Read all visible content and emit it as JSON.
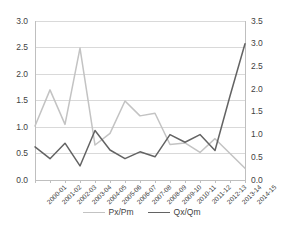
{
  "chart_data": {
    "type": "line",
    "title": "",
    "subtitle": "",
    "xlabel": "",
    "ylabel": "",
    "grid": true,
    "legend_position": "bottom",
    "categories": [
      "2000-01",
      "2001-02",
      "2002-03",
      "2003-04",
      "2004-05",
      "2005-06",
      "2006-07",
      "2007-08",
      "2008-09",
      "2009-10",
      "2010-11",
      "2011-12",
      "2012-13",
      "2013-14",
      "2014-15"
    ],
    "axes": {
      "left": {
        "label": "",
        "min": 0.0,
        "max": 3.0,
        "step": 0.5,
        "ticks": [
          "0.0",
          "0.5",
          "1.0",
          "1.5",
          "2.0",
          "2.5",
          "3.0"
        ]
      },
      "right": {
        "label": "",
        "min": 0.0,
        "max": 3.5,
        "step": 0.5,
        "ticks": [
          "0.0",
          "0.5",
          "1.0",
          "1.5",
          "2.0",
          "2.5",
          "3.0",
          "3.5"
        ]
      }
    },
    "series": [
      {
        "name": "Px/Pm",
        "axis": "left",
        "color": "#c3c3c3",
        "values": [
          1.02,
          1.7,
          1.05,
          2.49,
          0.66,
          0.88,
          1.49,
          1.21,
          1.26,
          0.67,
          0.7,
          0.52,
          0.78,
          0.5,
          0.22
        ]
      },
      {
        "name": "Qx/Qm",
        "axis": "right",
        "color": "#636363",
        "values": [
          0.73,
          0.47,
          0.81,
          0.31,
          1.09,
          0.66,
          0.47,
          0.62,
          0.51,
          1.0,
          0.83,
          1.0,
          0.65,
          1.85,
          3.0
        ]
      }
    ]
  },
  "legend": {
    "items": [
      {
        "label": "Px/Pm",
        "color": "#c3c3c3"
      },
      {
        "label": "Qx/Qm",
        "color": "#636363"
      }
    ]
  }
}
